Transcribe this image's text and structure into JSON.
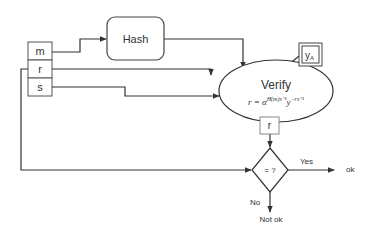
{
  "diagram": {
    "inputs": {
      "m": "m",
      "r": "r",
      "s": "s"
    },
    "hash": {
      "label": "Hash"
    },
    "verify": {
      "label": "Verify",
      "equation_lhs": "r = α",
      "equation_exp1": "H(m)s⁻¹",
      "equation_mid": "y",
      "equation_exp2": "−rs⁻¹"
    },
    "public_key": {
      "label": "y",
      "subscript": "A"
    },
    "r_output": {
      "label": "r"
    },
    "decision": {
      "label": "= ?",
      "yes_label": "Yes",
      "no_label": "No"
    },
    "outcomes": {
      "ok": "ok",
      "not_ok": "Not ok"
    },
    "colors": {
      "stroke": "#333333",
      "box_stroke": "#555555",
      "r_box_stroke": "#888888",
      "background": "#ffffff"
    }
  }
}
